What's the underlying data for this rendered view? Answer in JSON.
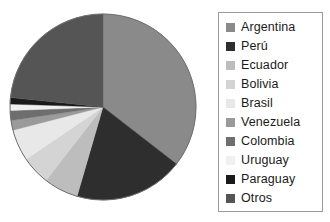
{
  "chart_data": {
    "type": "pie",
    "title": "",
    "subtitle": "",
    "xlabel": "",
    "ylabel": "",
    "grid": false,
    "legend_position": "right",
    "start_angle_deg": 0,
    "direction": "clockwise",
    "categories": [
      "Argentina",
      "Perú",
      "Ecuador",
      "Bolivia",
      "Brasil",
      "Venezuela",
      "Colombia",
      "Uruguay",
      "Paraguay",
      "Otros"
    ],
    "values": [
      35.5,
      19.0,
      6.0,
      5.0,
      5.5,
      1.7,
      1.7,
      1.1,
      1.1,
      23.4
    ],
    "unit": "percent",
    "colors": [
      "#8a8a8a",
      "#2e2e2e",
      "#bdbdbd",
      "#d4d4d4",
      "#e8e8e8",
      "#9a9a9a",
      "#6e6e6e",
      "#f0f0f0",
      "#1a1a1a",
      "#555555"
    ],
    "slices": [
      {
        "label": "Argentina",
        "value": 35.5,
        "color": "#8a8a8a",
        "start_deg": 0.0,
        "end_deg": 127.8
      },
      {
        "label": "Perú",
        "value": 19.0,
        "color": "#2e2e2e",
        "start_deg": 127.8,
        "end_deg": 196.2
      },
      {
        "label": "Ecuador",
        "value": 6.0,
        "color": "#bdbdbd",
        "start_deg": 196.2,
        "end_deg": 217.8
      },
      {
        "label": "Bolivia",
        "value": 5.0,
        "color": "#d4d4d4",
        "start_deg": 217.8,
        "end_deg": 235.8
      },
      {
        "label": "Brasil",
        "value": 5.5,
        "color": "#e8e8e8",
        "start_deg": 235.8,
        "end_deg": 255.6
      },
      {
        "label": "Venezuela",
        "value": 1.7,
        "color": "#9a9a9a",
        "start_deg": 255.6,
        "end_deg": 261.7
      },
      {
        "label": "Colombia",
        "value": 1.7,
        "color": "#6e6e6e",
        "start_deg": 261.7,
        "end_deg": 267.8
      },
      {
        "label": "Uruguay",
        "value": 1.1,
        "color": "#f0f0f0",
        "start_deg": 267.8,
        "end_deg": 271.8
      },
      {
        "label": "Paraguay",
        "value": 1.1,
        "color": "#1a1a1a",
        "start_deg": 271.8,
        "end_deg": 275.8
      },
      {
        "label": "Otros",
        "value": 23.4,
        "color": "#555555",
        "start_deg": 275.8,
        "end_deg": 360.0
      }
    ],
    "geometry": {
      "cx": 95,
      "cy": 97,
      "r": 93,
      "outline_color": "#6e6e6e"
    }
  },
  "legend": {
    "border_color": "#9a9a9a",
    "text_color": "#1a1a1a",
    "entries": [
      {
        "label": "Argentina",
        "color": "#8a8a8a"
      },
      {
        "label": "Perú",
        "color": "#2e2e2e"
      },
      {
        "label": "Ecuador",
        "color": "#bdbdbd"
      },
      {
        "label": "Bolivia",
        "color": "#d4d4d4"
      },
      {
        "label": "Brasil",
        "color": "#e8e8e8"
      },
      {
        "label": "Venezuela",
        "color": "#9a9a9a"
      },
      {
        "label": "Colombia",
        "color": "#6e6e6e"
      },
      {
        "label": "Uruguay",
        "color": "#f0f0f0"
      },
      {
        "label": "Paraguay",
        "color": "#1a1a1a"
      },
      {
        "label": "Otros",
        "color": "#555555"
      }
    ]
  }
}
